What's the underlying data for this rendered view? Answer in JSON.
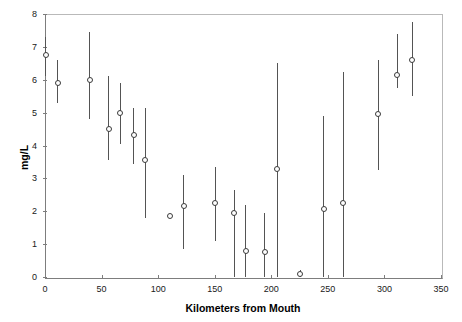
{
  "chart_data": {
    "type": "scatter",
    "title": "",
    "xlabel": "Kilometers from Mouth",
    "ylabel": "mg/L",
    "xlim": [
      0,
      350
    ],
    "ylim": [
      0,
      8
    ],
    "xticks": [
      0,
      50,
      100,
      150,
      200,
      250,
      300,
      350
    ],
    "yticks": [
      0,
      1,
      2,
      3,
      4,
      5,
      6,
      7,
      8
    ],
    "grid": false,
    "legend": null,
    "error_bar_style": "vertical-range-with-open-circle-marker",
    "x": [
      0,
      11,
      39,
      56,
      66,
      78,
      88,
      110,
      122,
      150,
      167,
      177,
      194,
      205,
      225,
      246,
      263,
      294,
      311,
      324
    ],
    "values": [
      6.75,
      5.9,
      5.98,
      4.5,
      5.0,
      4.33,
      3.55,
      1.87,
      2.15,
      2.25,
      1.95,
      0.8,
      0.75,
      3.3,
      0.1,
      2.08,
      2.25,
      4.95,
      6.15,
      6.6
    ],
    "y_low": [
      6.1,
      5.3,
      4.8,
      3.55,
      4.05,
      3.45,
      1.8,
      1.87,
      0.85,
      1.1,
      0.0,
      0.0,
      0.0,
      0.0,
      0.0,
      0.0,
      0.0,
      3.25,
      5.75,
      5.5
    ],
    "y_high": [
      7.3,
      6.6,
      7.45,
      6.1,
      5.9,
      5.15,
      5.15,
      1.87,
      3.1,
      3.35,
      2.65,
      2.2,
      1.95,
      6.5,
      0.2,
      4.9,
      6.25,
      6.6,
      7.4,
      7.75
    ],
    "points": [
      {
        "x": 0,
        "y": 6.75,
        "low": 6.1,
        "high": 7.3
      },
      {
        "x": 11,
        "y": 5.9,
        "low": 5.3,
        "high": 6.6
      },
      {
        "x": 39,
        "y": 5.98,
        "low": 4.8,
        "high": 7.45
      },
      {
        "x": 56,
        "y": 4.5,
        "low": 3.55,
        "high": 6.1
      },
      {
        "x": 66,
        "y": 5.0,
        "low": 4.05,
        "high": 5.9
      },
      {
        "x": 78,
        "y": 4.33,
        "low": 3.45,
        "high": 5.15
      },
      {
        "x": 88,
        "y": 3.55,
        "low": 1.8,
        "high": 5.15
      },
      {
        "x": 110,
        "y": 1.87,
        "low": 1.87,
        "high": 1.87
      },
      {
        "x": 122,
        "y": 2.15,
        "low": 0.85,
        "high": 3.1
      },
      {
        "x": 150,
        "y": 2.25,
        "low": 1.1,
        "high": 3.35
      },
      {
        "x": 167,
        "y": 1.95,
        "low": 0.0,
        "high": 2.65
      },
      {
        "x": 177,
        "y": 0.8,
        "low": 0.0,
        "high": 2.2
      },
      {
        "x": 194,
        "y": 0.75,
        "low": 0.0,
        "high": 1.95
      },
      {
        "x": 205,
        "y": 3.3,
        "low": 0.0,
        "high": 6.5
      },
      {
        "x": 225,
        "y": 0.1,
        "low": 0.0,
        "high": 0.2
      },
      {
        "x": 246,
        "y": 2.08,
        "low": 0.0,
        "high": 4.9
      },
      {
        "x": 263,
        "y": 2.25,
        "low": 0.0,
        "high": 6.25
      },
      {
        "x": 294,
        "y": 4.95,
        "low": 3.25,
        "high": 6.6
      },
      {
        "x": 311,
        "y": 6.15,
        "low": 5.75,
        "high": 7.4
      },
      {
        "x": 324,
        "y": 6.6,
        "low": 5.5,
        "high": 7.75
      }
    ]
  },
  "axis": {
    "y_tick_labels": [
      "0",
      "1",
      "2",
      "3",
      "4",
      "5",
      "6",
      "7",
      "8"
    ],
    "x_tick_labels": [
      "0",
      "50",
      "100",
      "150",
      "200",
      "250",
      "300",
      "350"
    ],
    "y_title": "mg/L",
    "x_title": "Kilometers from Mouth"
  },
  "colors": {
    "axis": "#7d7d7d",
    "frame_light": "#b9b9b9",
    "whisker": "#545454",
    "marker_edge": "#3a3a3a",
    "marker_fill": "#ffffff",
    "text": "#000000",
    "background": "#ffffff"
  }
}
